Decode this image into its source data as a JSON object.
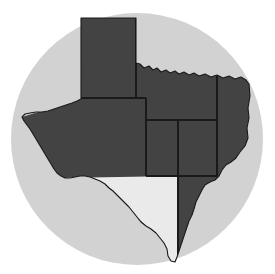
{
  "figure": {
    "kind": "thematic-region-map",
    "title": "",
    "width": 275,
    "height": 274,
    "page_background": "#ffffff"
  },
  "backdrop": {
    "shape": "circle",
    "center_x": 137,
    "center_y": 139,
    "radius": 126,
    "fill": "#d2d2d2",
    "name": "circular-backdrop"
  },
  "colors": {
    "region_dark": "#434343",
    "region_light": "#eaeaea",
    "border_line": "#1a1a1a",
    "backdrop_gray": "#d2d2d2",
    "page_white": "#ffffff"
  },
  "state_outline": {
    "name": "texas-outline",
    "stroke": "#1a1a1a",
    "stroke_width": 1.1
  },
  "regions": [
    {
      "id": "panhandle",
      "label": "Panhandle",
      "fill": "#434343",
      "shade": "dark",
      "position": "north"
    },
    {
      "id": "north-central",
      "label": "North Central",
      "fill": "#434343",
      "shade": "dark",
      "position": "north-central"
    },
    {
      "id": "northeast",
      "label": "Northeast",
      "fill": "#434343",
      "shade": "dark",
      "position": "northeast"
    },
    {
      "id": "far-west",
      "label": "Far West",
      "fill": "#434343",
      "shade": "dark",
      "position": "west"
    },
    {
      "id": "edwards-plateau",
      "label": "Edwards Plateau",
      "fill": "#434343",
      "shade": "dark",
      "position": "central-west"
    },
    {
      "id": "central",
      "label": "Central",
      "fill": "#434343",
      "shade": "dark",
      "position": "central"
    },
    {
      "id": "upper-coast",
      "label": "Upper Coast",
      "fill": "#434343",
      "shade": "dark",
      "position": "southeast"
    },
    {
      "id": "south-central",
      "label": "South Central",
      "fill": "#434343",
      "shade": "dark",
      "position": "south-central"
    },
    {
      "id": "southern",
      "label": "Southern",
      "fill": "#eaeaea",
      "shade": "light",
      "position": "southwest"
    }
  ],
  "internal_borders": [
    {
      "id": "panhandle-south-line",
      "orientation": "horizontal",
      "note": "base of panhandle block"
    },
    {
      "id": "panhandle-east-line",
      "orientation": "vertical",
      "note": "east side of panhandle block"
    },
    {
      "id": "mid-horizontal-line",
      "orientation": "horizontal",
      "note": "divides north central from central"
    },
    {
      "id": "central-west-vertical",
      "orientation": "vertical",
      "note": "west edge of central block"
    },
    {
      "id": "central-east-vertical",
      "orientation": "vertical",
      "note": "east edge of central block"
    },
    {
      "id": "far-east-vertical",
      "orientation": "vertical",
      "note": "west edge of east region"
    },
    {
      "id": "southern-north-line",
      "orientation": "horizontal",
      "note": "north edge of light southern region"
    }
  ]
}
